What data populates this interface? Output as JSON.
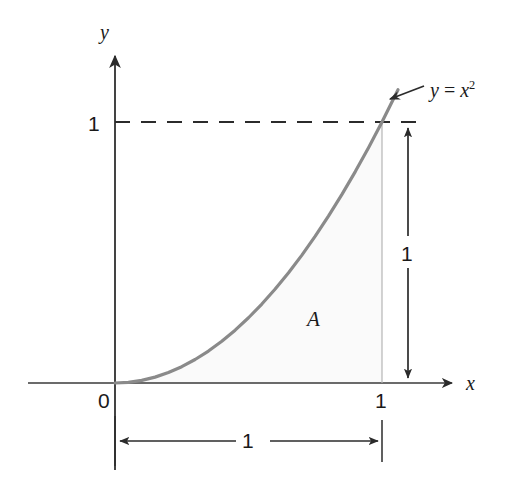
{
  "figure": {
    "kind": "cartesian-plot",
    "background_color": "#ffffff",
    "axis_color": "#3a3a3a",
    "curve_color": "#8a8a8a",
    "dashed_color": "#2b2b2b",
    "guide_color": "#b8b8b8",
    "shade_color": "#fafafa",
    "text_color": "#1a1a1a"
  },
  "axes": {
    "y_label": "y",
    "x_label": "x",
    "origin_label": "0",
    "y_tick_label": "1",
    "x_tick_label": "1"
  },
  "annotations": {
    "area_label": "A",
    "curve_equation_prefix": "y",
    "curve_equation_operator": " = ",
    "curve_equation_base": "x",
    "curve_equation_exponent": "2",
    "vertical_dimension_label": "1",
    "horizontal_dimension_label": "1",
    "footer_mark": ""
  },
  "chart_data": {
    "type": "line",
    "title": "",
    "subtitle": "",
    "xlabel": "x",
    "ylabel": "y",
    "xlim": [
      0,
      1.12
    ],
    "ylim": [
      0,
      1.13
    ],
    "grid": false,
    "legend": "none",
    "series": [
      {
        "name": "y = x^2",
        "equation": "y = x^2",
        "color": "#8a8a8a",
        "x": [
          0,
          0.05,
          0.1,
          0.15,
          0.2,
          0.25,
          0.3,
          0.35,
          0.4,
          0.45,
          0.5,
          0.55,
          0.6,
          0.65,
          0.7,
          0.75,
          0.8,
          0.85,
          0.9,
          0.95,
          1.0,
          1.06
        ],
        "values": [
          0,
          0.0025,
          0.01,
          0.0225,
          0.04,
          0.0625,
          0.09,
          0.1225,
          0.16,
          0.2025,
          0.25,
          0.3025,
          0.36,
          0.4225,
          0.49,
          0.5625,
          0.64,
          0.7225,
          0.81,
          0.9025,
          1.0,
          1.1236
        ]
      }
    ],
    "shaded_region": {
      "label": "A",
      "description": "Area under y = x^2 from x = 0 to x = 1",
      "x_from": 0,
      "x_to": 1,
      "bounded_above_by": "y = x^2",
      "bounded_below_by": "y = 0",
      "value": 0.3333
    },
    "reference_lines": [
      {
        "name": "y-equals-one",
        "style": "dashed",
        "orientation": "horizontal",
        "value": 1
      },
      {
        "name": "x-equals-one",
        "style": "solid-thin",
        "orientation": "vertical",
        "value": 1
      }
    ],
    "dimensions": [
      {
        "name": "height-dimension",
        "label": "1",
        "orientation": "vertical",
        "from": 0,
        "to": 1
      },
      {
        "name": "width-dimension",
        "label": "1",
        "orientation": "horizontal",
        "from": 0,
        "to": 1
      }
    ],
    "ticks": {
      "x": [
        0,
        1
      ],
      "y": [
        1
      ],
      "x_labels": [
        "0",
        "1"
      ],
      "y_labels": [
        "1"
      ]
    }
  }
}
